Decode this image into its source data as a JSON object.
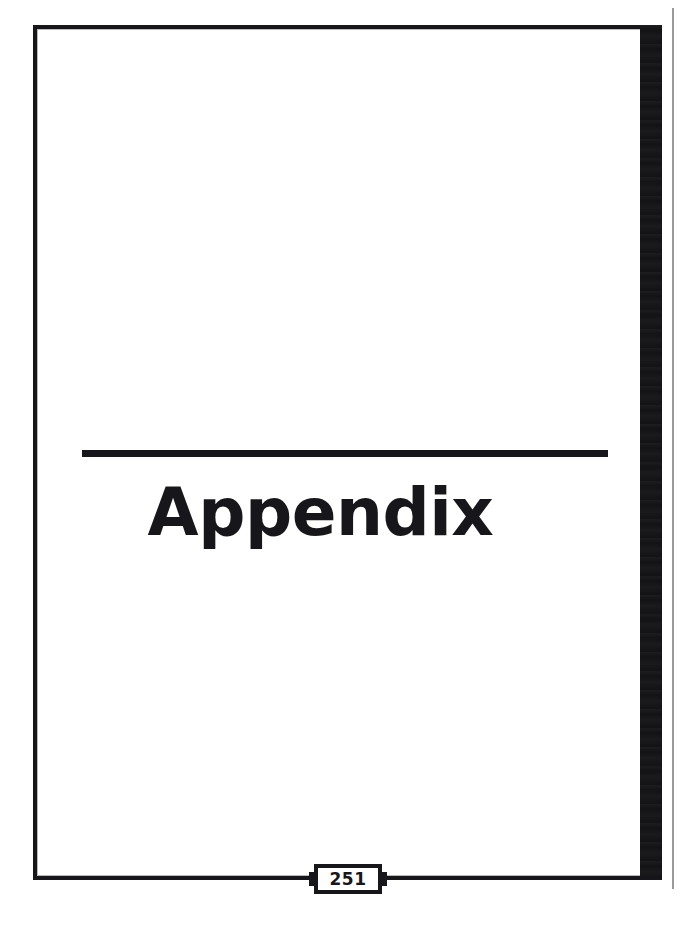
{
  "document": {
    "kind": "book-section-divider-page",
    "page_label": "251"
  },
  "title": {
    "heading": "Appendix"
  },
  "footer": {
    "page_number": "251"
  },
  "decor": {
    "title_rule": "horizontal-rule",
    "spine_bar": "black-spine-bar",
    "scan_edge": "scanner-edge-line",
    "frame": "page-border-frame"
  },
  "colors": {
    "ink": "#17161a",
    "paper": "#ffffff",
    "scan_edge": "#9a9a9c"
  }
}
